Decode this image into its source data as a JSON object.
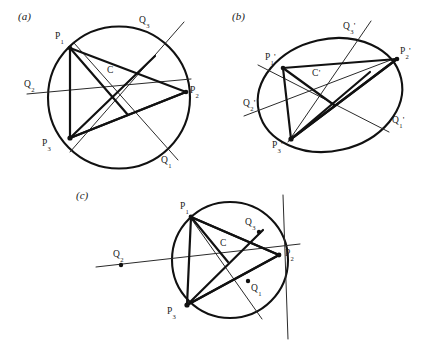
{
  "figure": {
    "background_color": "#ffffff",
    "stroke_color": "#111111",
    "thin_stroke_color": "#2a2a2a"
  },
  "panels": {
    "a": {
      "tag": "(a)",
      "shape": "circle",
      "center_label": "C",
      "vertices": [
        {
          "label_base": "P",
          "label_sub": "1"
        },
        {
          "label_base": "P",
          "label_sub": "2"
        },
        {
          "label_base": "P",
          "label_sub": "3"
        }
      ],
      "q_points": [
        {
          "label_base": "Q",
          "label_sub": "1"
        },
        {
          "label_base": "Q",
          "label_sub": "2"
        },
        {
          "label_base": "Q",
          "label_sub": "3"
        }
      ]
    },
    "b": {
      "tag": "(b)",
      "shape": "ellipse",
      "center_label": "C",
      "center_prime": "'",
      "vertices": [
        {
          "label_base": "P",
          "label_sub": "1",
          "prime": "'"
        },
        {
          "label_base": "P",
          "label_sub": "2",
          "prime": "'"
        },
        {
          "label_base": "P",
          "label_sub": "3",
          "prime": "'"
        }
      ],
      "q_points": [
        {
          "label_base": "Q",
          "label_sub": "1",
          "prime": "'"
        },
        {
          "label_base": "Q",
          "label_sub": "2",
          "prime": "'"
        },
        {
          "label_base": "Q",
          "label_sub": "3",
          "prime": "'"
        }
      ]
    },
    "c": {
      "tag": "(c)",
      "shape": "circle",
      "center_label": "C",
      "vertices": [
        {
          "label_base": "P",
          "label_sub": "1"
        },
        {
          "label_base": "P",
          "label_sub": "2"
        },
        {
          "label_base": "P",
          "label_sub": "3"
        }
      ],
      "q_points": [
        {
          "label_base": "Q",
          "label_sub": "1"
        },
        {
          "label_base": "Q",
          "label_sub": "2"
        },
        {
          "label_base": "Q",
          "label_sub": "3"
        }
      ]
    }
  }
}
